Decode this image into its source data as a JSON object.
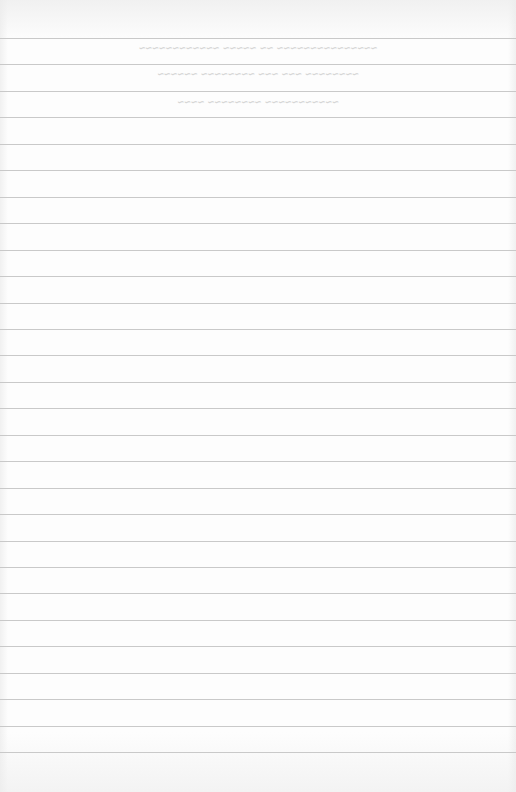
{
  "page": {
    "type": "ruled-notebook-paper",
    "background_color": "#fdfdfd",
    "rule_color": "#c9c9c9",
    "rule_count": 28,
    "first_rule_y": 38,
    "rule_spacing": 26.45,
    "bleed_through_text": [
      {
        "y": 42,
        "text": "~~~~~~~~~~~~~~~ ~~ ~~~~~ ~~~~~~~~~~~~"
      },
      {
        "y": 68,
        "text": "~~~~~~~~ ~~~ ~~~ ~~~~~~~~ ~~~~~~"
      },
      {
        "y": 96,
        "text": "~~~~~~~~~~~ ~~~~~~~~ ~~~~"
      }
    ]
  }
}
